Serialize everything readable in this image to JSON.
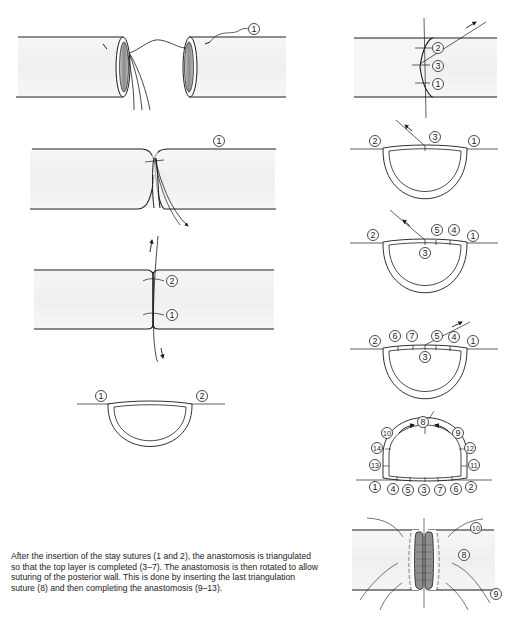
{
  "figure": {
    "colors": {
      "line": "#1a1a1a",
      "vessel_fill": "#f2f2f2",
      "lumen_fill": "#9a9a9a",
      "background": "#ffffff"
    },
    "panels": [
      {
        "id": "left-1",
        "description": "Two vessel ends with stay suture 1 passed",
        "labels": [
          "1"
        ]
      },
      {
        "id": "left-2",
        "description": "Stay suture 1 tied, ends approximated",
        "labels": [
          "1"
        ]
      },
      {
        "id": "left-3",
        "description": "Stay sutures 1 and 2 placed",
        "labels": [
          "2",
          "1"
        ]
      },
      {
        "id": "left-4",
        "description": "Cross-section with stay sutures",
        "labels": [
          "1",
          "2"
        ]
      },
      {
        "id": "right-1",
        "description": "Triangulation suture 3 inserted",
        "labels": [
          "2",
          "3",
          "1"
        ]
      },
      {
        "id": "right-2",
        "description": "Cross-section with suture 3",
        "labels": [
          "2",
          "3",
          "1"
        ]
      },
      {
        "id": "right-3",
        "description": "Sutures 4 and 5 placed",
        "labels": [
          "2",
          "5",
          "4",
          "1",
          "3"
        ]
      },
      {
        "id": "right-4",
        "description": "Top layer completed with 6 and 7",
        "labels": [
          "2",
          "6",
          "7",
          "5",
          "4",
          "1",
          "3"
        ]
      },
      {
        "id": "right-5",
        "description": "Rotated; posterior wall sutured 8-14",
        "labels": [
          "8",
          "10",
          "9",
          "14",
          "12",
          "13",
          "11",
          "1",
          "4",
          "5",
          "3",
          "7",
          "6",
          "2"
        ]
      },
      {
        "id": "right-6",
        "description": "Completed anastomosis",
        "labels": [
          "10",
          "8",
          "9"
        ]
      }
    ]
  },
  "labels": {
    "l1_a": "1",
    "l2_a": "1",
    "l3_a": "2",
    "l3_b": "1",
    "l4_a": "1",
    "l4_b": "2",
    "r1_a": "2",
    "r1_b": "3",
    "r1_c": "1",
    "r2_a": "2",
    "r2_b": "3",
    "r2_c": "1",
    "r3_a": "2",
    "r3_b": "5",
    "r3_c": "4",
    "r3_d": "1",
    "r3_e": "3",
    "r4_a": "2",
    "r4_b": "6",
    "r4_c": "7",
    "r4_d": "5",
    "r4_e": "4",
    "r4_f": "1",
    "r4_g": "3",
    "r5_8": "8",
    "r5_10": "10",
    "r5_9": "9",
    "r5_14": "14",
    "r5_12": "12",
    "r5_13": "13",
    "r5_11": "11",
    "r5_1": "1",
    "r5_4": "4",
    "r5_5": "5",
    "r5_3": "3",
    "r5_7": "7",
    "r5_6": "6",
    "r5_2": "2",
    "r6_10": "10",
    "r6_8": "8",
    "r6_9": "9"
  },
  "caption": "After the insertion of the stay sutures (1 and 2), the anastomosis is triangulated so that the top layer is completed (3–7). The anastomosis is then rotated to allow suturing of the posterior wall. This is done by inserting the last triangulation suture (8) and then completing the anastomosis (9–13)."
}
